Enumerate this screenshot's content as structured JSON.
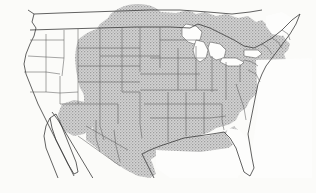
{
  "figure": {
    "type": "range-distribution-map",
    "region": "North America",
    "title": "",
    "caption": "",
    "background_color": "#fbfbf9",
    "frame": {
      "left_rule": true,
      "top_rule": true,
      "bottom_rule": true,
      "line_color": "#2b2b2b"
    }
  },
  "legend": {
    "shaded_label": "",
    "unshaded_label": "",
    "shaded_color": "#bdbdbd",
    "unshaded_color": "#ffffff",
    "boundary_color": "#555555",
    "coastline_color": "#3c3c3c"
  },
  "map": {
    "shaded_regions": [
      "Great Plains",
      "Midwest",
      "Great Lakes states",
      "Mid-Atlantic",
      "Southeast",
      "Texas",
      "eastern New Mexico",
      "southern Prairie Provinces",
      "northern Mexico"
    ],
    "unshaded_regions": [
      "Pacific Coast",
      "Great Basin",
      "Rocky Mountains",
      "Florida",
      "northern New England",
      "Baja California",
      "Great Lakes water bodies"
    ],
    "features": {
      "great_lakes": "unshaded water",
      "florida_peninsula": "unshaded",
      "baja_peninsula": "unshaded",
      "canada_extension": "shaded bulge north of Montana and North Dakota"
    }
  },
  "colors": {
    "stipple_gray": "#bdbdbd",
    "stipple_gray_dark": "#a9a9a9",
    "state_line": "#5a5a5a",
    "coast_line": "#333333",
    "paper": "#fbfbf9"
  }
}
